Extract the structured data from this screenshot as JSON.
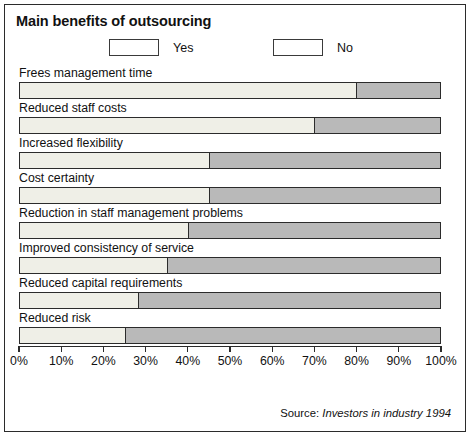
{
  "chart_data": {
    "type": "bar",
    "orientation": "horizontal",
    "stacked": true,
    "normalized_percent": true,
    "title": "Main benefits of outsourcing",
    "xlabel": "",
    "ylabel": "",
    "xlim": [
      0,
      100
    ],
    "grid": false,
    "legend_position": "top",
    "categories": [
      "Frees management time",
      "Reduced staff costs",
      "Increased flexibility",
      "Cost certainty",
      "Reduction in staff management problems",
      "Improved consistency of service",
      "Reduced capital requirements",
      "Reduced risk"
    ],
    "series": [
      {
        "name": "Yes",
        "color": "#efefe7",
        "values": [
          80,
          70,
          45,
          45,
          40,
          35,
          28,
          25
        ]
      },
      {
        "name": "No",
        "color": "#b9b9b9",
        "values": [
          20,
          30,
          55,
          55,
          60,
          65,
          72,
          75
        ]
      }
    ],
    "tick_values": [
      0,
      10,
      20,
      30,
      40,
      50,
      60,
      70,
      80,
      90,
      100
    ],
    "tick_labels": [
      "0%",
      "10%",
      "20%",
      "30%",
      "40%",
      "50%",
      "60%",
      "70%",
      "80%",
      "90%",
      "100%"
    ],
    "annotations": {
      "source_prefix": "Source:",
      "source_italic": "Investors in industry 1994"
    }
  }
}
